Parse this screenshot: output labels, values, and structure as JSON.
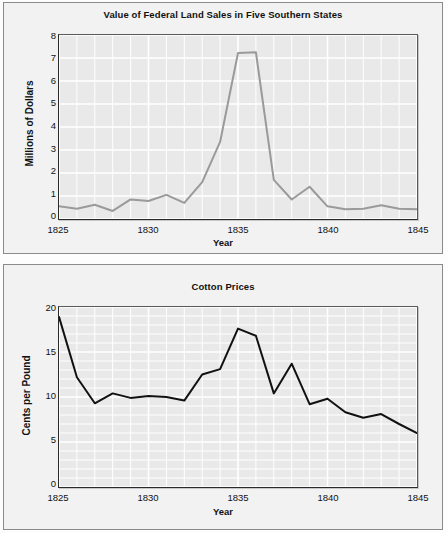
{
  "page": {
    "background": "#fdfdfd",
    "panel_background": "#f2f2f2",
    "plot_background": "#e9e9e9",
    "gridline_color": "#ffffff",
    "axis_color": "#2a2a2a"
  },
  "chart_data": [
    {
      "id": "land-sales",
      "type": "line",
      "title": "Value of Federal Land Sales in Five Southern States",
      "xlabel": "Year",
      "ylabel": "Millions of Dollars",
      "xlim": [
        1825,
        1845
      ],
      "ylim": [
        0,
        8
      ],
      "xticks": [
        1825,
        1830,
        1835,
        1840,
        1845
      ],
      "xtick_labels": [
        "1825",
        "1830",
        "1835",
        "1840",
        "1845"
      ],
      "yticks": [
        0,
        1,
        2,
        3,
        4,
        5,
        6,
        7,
        8
      ],
      "ytick_labels": [
        "0",
        "1",
        "2",
        "3",
        "4",
        "5",
        "6",
        "7",
        "8"
      ],
      "grid": true,
      "legend": "none",
      "line_color": "#9a9a9a",
      "line_width": 2,
      "x": [
        1825,
        1826,
        1827,
        1828,
        1829,
        1830,
        1831,
        1832,
        1833,
        1834,
        1835,
        1836,
        1837,
        1838,
        1839,
        1840,
        1841,
        1842,
        1843,
        1844,
        1845
      ],
      "values": [
        0.55,
        0.45,
        0.62,
        0.35,
        0.85,
        0.78,
        1.05,
        0.7,
        1.6,
        3.35,
        7.22,
        7.25,
        1.7,
        0.85,
        1.4,
        0.55,
        0.42,
        0.45,
        0.6,
        0.45,
        0.42
      ]
    },
    {
      "id": "cotton-prices",
      "type": "line",
      "title": "Cotton Prices",
      "xlabel": "Year",
      "ylabel": "Cents per Pound",
      "xlim": [
        1825,
        1845
      ],
      "ylim": [
        0,
        20
      ],
      "xticks": [
        1825,
        1830,
        1835,
        1840,
        1845
      ],
      "xtick_labels": [
        "1825",
        "1830",
        "1835",
        "1840",
        "1845"
      ],
      "yticks": [
        0,
        5,
        10,
        15,
        20
      ],
      "ytick_labels": [
        "0",
        "5",
        "10",
        "15",
        "20"
      ],
      "grid": true,
      "legend": "none",
      "line_color": "#111111",
      "line_width": 2,
      "x": [
        1825,
        1826,
        1827,
        1828,
        1829,
        1830,
        1831,
        1832,
        1833,
        1834,
        1835,
        1836,
        1837,
        1838,
        1839,
        1840,
        1841,
        1842,
        1843,
        1844,
        1845
      ],
      "values": [
        18.9,
        12.2,
        9.3,
        10.4,
        9.9,
        10.1,
        10.0,
        9.6,
        12.5,
        13.1,
        17.6,
        16.8,
        10.4,
        13.7,
        9.2,
        9.8,
        8.3,
        7.7,
        8.1,
        7.0,
        6.0
      ]
    }
  ]
}
